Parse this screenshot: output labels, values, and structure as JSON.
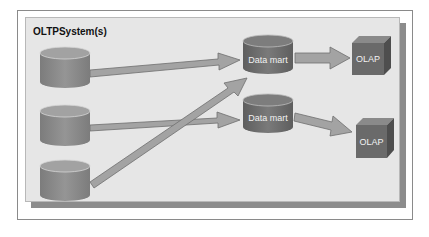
{
  "diagram": {
    "title": "OLTPSystem(s)",
    "sources": [
      {
        "id": "oltp-1",
        "type": "database-cylinder"
      },
      {
        "id": "oltp-2",
        "type": "database-cylinder"
      },
      {
        "id": "oltp-3",
        "type": "database-cylinder"
      }
    ],
    "data_marts": [
      {
        "id": "dm-1",
        "label": "Data mart"
      },
      {
        "id": "dm-2",
        "label": "Data mart"
      }
    ],
    "olap": [
      {
        "id": "olap-1",
        "label": "OLAP"
      },
      {
        "id": "olap-2",
        "label": "OLAP"
      }
    ],
    "edges": [
      {
        "from": "oltp-1",
        "to": "dm-1"
      },
      {
        "from": "oltp-2",
        "to": "dm-2"
      },
      {
        "from": "oltp-3",
        "to": "dm-1"
      },
      {
        "from": "dm-1",
        "to": "olap-1"
      },
      {
        "from": "dm-2",
        "to": "olap-2"
      }
    ],
    "colors": {
      "panel": "#e6e6e6",
      "shadow": "#8c8c8c",
      "cylinder_body": "#8a8a8a",
      "cylinder_top": "#a0a0a0",
      "data_mart_body": "#6e6e6e",
      "cube_front": "#6a6a6a",
      "arrow": "#a3a3a3"
    }
  }
}
